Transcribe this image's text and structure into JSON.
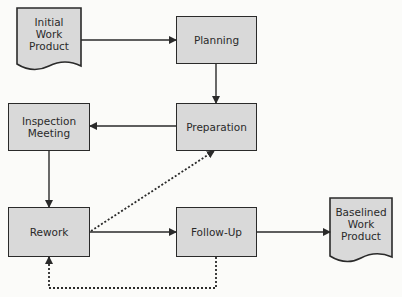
{
  "diagram": {
    "nodes": {
      "initial": {
        "label": "Initial\nWork\nProduct",
        "lines": [
          "Initial",
          "Work",
          "Product"
        ],
        "shape": "document"
      },
      "planning": {
        "label": "Planning",
        "shape": "rectangle"
      },
      "preparation": {
        "label": "Preparation",
        "shape": "rectangle"
      },
      "inspection": {
        "label": "Inspection\nMeeting",
        "lines": [
          "Inspection",
          "Meeting"
        ],
        "shape": "rectangle"
      },
      "rework": {
        "label": "Rework",
        "shape": "rectangle"
      },
      "followup": {
        "label": "Follow-Up",
        "shape": "rectangle"
      },
      "baselined": {
        "label": "Baselined\nWork\nProduct",
        "lines": [
          "Baselined",
          "Work",
          "Product"
        ],
        "shape": "document"
      }
    },
    "edges": [
      {
        "from": "Initial Work Product",
        "to": "Planning",
        "style": "solid"
      },
      {
        "from": "Planning",
        "to": "Preparation",
        "style": "solid"
      },
      {
        "from": "Preparation",
        "to": "Inspection Meeting",
        "style": "solid"
      },
      {
        "from": "Inspection Meeting",
        "to": "Rework",
        "style": "solid"
      },
      {
        "from": "Rework",
        "to": "Follow-Up",
        "style": "solid"
      },
      {
        "from": "Follow-Up",
        "to": "Baselined Work Product",
        "style": "solid"
      },
      {
        "from": "Rework",
        "to": "Preparation",
        "style": "dotted"
      },
      {
        "from": "Follow-Up",
        "to": "Rework",
        "style": "dotted"
      }
    ],
    "colors": {
      "fill": "#d9d9d9",
      "stroke": "#2a2a2a",
      "background": "#fbfbf9"
    }
  }
}
